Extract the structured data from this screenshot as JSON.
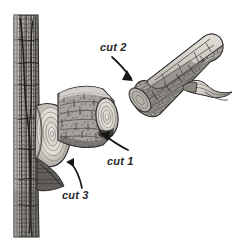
{
  "figure": {
    "background_color": "#ffffff",
    "width": 236,
    "height": 251,
    "ink_color": "#2b2b2b",
    "label_color": "#262626"
  },
  "labels": {
    "cut1": "cut 1",
    "cut2": "cut 2",
    "cut3": "cut 3"
  },
  "annotations": [
    {
      "id": "cut2",
      "label": "cut 2",
      "label_x": 100,
      "label_y": 51,
      "description": "Top cut that severs the branch stub from the removed limb",
      "arrow_from": [
        112,
        57
      ],
      "arrow_to": [
        140,
        84
      ]
    },
    {
      "id": "cut1",
      "label": "cut 1",
      "label_x": 107,
      "label_y": 161,
      "description": "Undercut made on the underside of the branch",
      "arrow_from": [
        126,
        148
      ],
      "arrow_to": [
        101,
        135
      ]
    },
    {
      "id": "cut3",
      "label": "cut 3",
      "label_x": 62,
      "label_y": 196,
      "description": "Final cut just outside the branch collar",
      "arrow_from": [
        79,
        186
      ],
      "arrow_to": [
        69,
        160
      ]
    }
  ],
  "parts": {
    "trunk": {
      "name": "tree trunk",
      "texture": "vertical furrowed bark",
      "x": 13,
      "y": 15,
      "width": 26,
      "height": 222
    },
    "branch_collar": {
      "name": "branch collar",
      "texture": "concentric growth rings"
    },
    "branch_stub": {
      "name": "remaining branch stub",
      "texture": "horizontal bark striations"
    },
    "removed_limb": {
      "name": "removed limb section",
      "texture": "rough plated bark",
      "has_side_twig": true
    }
  },
  "palette": {
    "bark_light": "#d9d6d1",
    "bark_mid": "#a8a49e",
    "bark_dark": "#5d5a56",
    "bark_darkest": "#2e2c2a",
    "ring_light": "#e8e4de",
    "ring_mid": "#bdb8b1",
    "outline": "#2b2b2b"
  }
}
